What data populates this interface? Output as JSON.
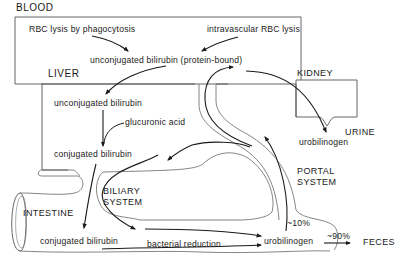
{
  "regions": {
    "blood": "BLOOD",
    "liver": "LIVER",
    "kidney": "KIDNEY",
    "urine": "URINE",
    "intestine": "INTESTINE",
    "biliary_line1": "BILIARY",
    "biliary_line2": "SYSTEM",
    "portal_line1": "PORTAL",
    "portal_line2": "SYSTEM",
    "feces": "FECES"
  },
  "labels": {
    "rbc_phagocytosis": "RBC lysis by phagocytosis",
    "rbc_intravascular": "intravascular RBC lysis",
    "unconj_blood": "unconjugated bilirubin (protein-bound)",
    "unconj_liver": "unconjugated bilirubin",
    "glucuronic_acid": "glucuronic acid",
    "conj_liver": "conjugated bilirubin",
    "conj_intestine": "conjugated bilirubin",
    "bacterial_reduction": "bacterial reduction",
    "urobilinogen_intestine": "urobilinogen",
    "urobilinogen_urine": "urobilinogen",
    "pct_portal": "~10%",
    "pct_feces": "~90%"
  },
  "colors": {
    "line": "#2a2a2a",
    "outline": "#555555",
    "background": "#ffffff"
  }
}
